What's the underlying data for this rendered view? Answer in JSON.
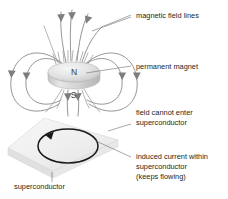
{
  "figure": {
    "background_color": "#ffffff"
  },
  "annotations": [
    {
      "id": "magnetic-field-lines",
      "text": "magnetic field lines",
      "x": 133,
      "y": 16
    },
    {
      "id": "permanent-magnet",
      "text": "permanent magnet",
      "x": 133,
      "y": 67
    },
    {
      "id": "field-cannot-enter",
      "line1": "field cannot enter",
      "line2": "superconductor",
      "x": 133,
      "y": 113
    },
    {
      "id": "induced-current",
      "line1": "induced current within",
      "line2": "superconductor",
      "line3": "(keeps flowing)",
      "x": 133,
      "y": 156
    },
    {
      "id": "superconductor",
      "text": "superconductor",
      "x": 13,
      "y": 186
    }
  ],
  "magnet": {
    "north_pole_label": "N",
    "south_pole_label": "S",
    "body_color": "#d9d9d9",
    "top_color": "#eeeeee",
    "center_x": 74,
    "center_y": 73
  },
  "superconductor": {
    "slab_color": "#f0f0f0",
    "slab_edge_color": "#d2d2d2",
    "side_color": "#e2e2e2"
  },
  "current_loop": {
    "color": "#1a1a1a",
    "center_x": 68,
    "center_y": 146,
    "rx": 30,
    "ry": 17
  },
  "colors": {
    "field_line": "#8a8a8a",
    "text": "#231f20",
    "leader": "#6f6f6f",
    "current": "#1a1a1a",
    "background": "#ffffff"
  }
}
